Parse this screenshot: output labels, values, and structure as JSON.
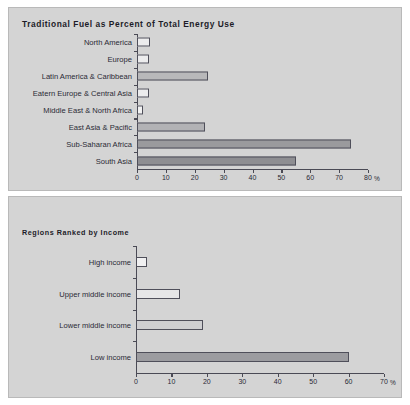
{
  "charts": {
    "top": {
      "title": "Traditional Fuel as Percent of Total Energy Use",
      "unit": "%",
      "ticks": [
        "0",
        "10",
        "20",
        "30",
        "40",
        "50",
        "60",
        "70",
        "80"
      ]
    },
    "bottom": {
      "title": "Regions Ranked by Income",
      "unit": "%",
      "ticks": [
        "0",
        "10",
        "20",
        "30",
        "40",
        "50",
        "60",
        "70"
      ]
    }
  },
  "chart_data": [
    {
      "type": "bar",
      "orientation": "horizontal",
      "title": "Traditional Fuel as Percent of Total Energy Use",
      "xlabel": "%",
      "ylabel": "",
      "xlim": [
        0,
        80
      ],
      "xticks": [
        0,
        10,
        20,
        30,
        40,
        50,
        60,
        70,
        80
      ],
      "grid": false,
      "legend": "none",
      "categories": [
        "North America",
        "Europe",
        "Latin America & Caribbean",
        "Eatern Europe & Central Asia",
        "Middle East & North Africa",
        "East Asia & Pacific",
        "Sub-Saharan Africa",
        "South Asia"
      ],
      "values": [
        4.6,
        4.2,
        24.5,
        4.2,
        2.0,
        23.5,
        74.0,
        55.0
      ],
      "bar_colors": [
        "#ececed",
        "#ececed",
        "#b8b8ba",
        "#ececed",
        "#f2f2f2",
        "#b2b2b5",
        "#9a9a9d",
        "#8e8e92"
      ]
    },
    {
      "type": "bar",
      "orientation": "horizontal",
      "title": "Regions Ranked by Income",
      "xlabel": "%",
      "ylabel": "",
      "xlim": [
        0,
        70
      ],
      "xticks": [
        0,
        10,
        20,
        30,
        40,
        50,
        60,
        70
      ],
      "grid": false,
      "legend": "none",
      "categories": [
        "High income",
        "Upper middle income",
        "Lower middle income",
        "Low income"
      ],
      "values": [
        3.0,
        12.5,
        19.0,
        60.0
      ],
      "bar_colors": [
        "#f0f0f1",
        "#e6e6e7",
        "#cfcfd1",
        "#9c9ca0"
      ]
    }
  ]
}
